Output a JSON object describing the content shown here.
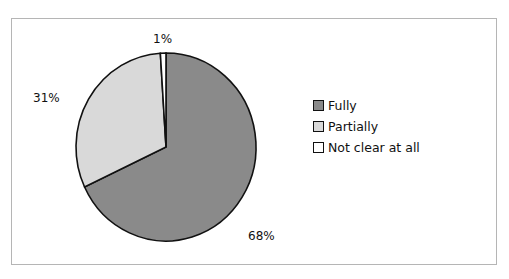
{
  "chart_data": {
    "type": "pie",
    "title": "",
    "categories": [
      "Fully",
      "Partially",
      "Not clear at all"
    ],
    "values": [
      68,
      31,
      1
    ],
    "labels": [
      "68%",
      "31%",
      "1%"
    ],
    "colors": [
      "#8a8a8a",
      "#d9d9d9",
      "#ffffff"
    ],
    "legend_position": "right",
    "start_angle_deg": 0,
    "direction": "clockwise"
  },
  "legend": {
    "items": [
      {
        "label": "Fully",
        "color": "#8a8a8a"
      },
      {
        "label": "Partially",
        "color": "#d9d9d9"
      },
      {
        "label": "Not clear at all",
        "color": "#ffffff"
      }
    ]
  }
}
